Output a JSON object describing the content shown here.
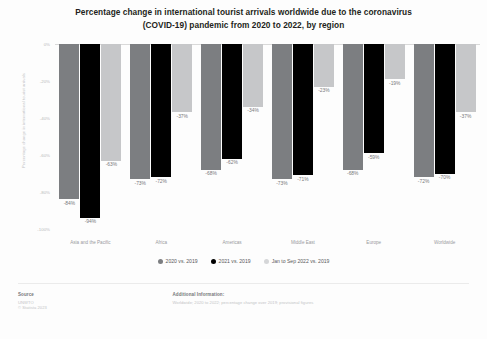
{
  "title": {
    "line1": "Percentage change in international tourist arrivals worldwide due to the coronavirus",
    "line2": "(COVID-19) pandemic from 2020 to 2022, by region"
  },
  "legend": {
    "items": [
      {
        "label": "2020 vs. 2019",
        "color": "#7c7e81"
      },
      {
        "label": "2021 vs. 2019",
        "color": "#000000"
      },
      {
        "label": "Jan to Sep 2022 vs. 2019",
        "color": "#d5d6d8"
      }
    ]
  },
  "footer": {
    "source_head": "Source",
    "source_lines": [
      "UNWTO",
      "© Statista 2023"
    ],
    "info_head": "Additional Information:",
    "info_lines": [
      "Worldwide; 2020 to 2022; percentage change over 2019; provisional figures"
    ]
  },
  "chart_data": {
    "type": "bar",
    "title": "Percentage change in international tourist arrivals worldwide due to the coronavirus (COVID-19) pandemic from 2020 to 2022, by region",
    "xlabel": "",
    "ylabel": "Percentage change in international tourist arrivals",
    "ylim": [
      -100,
      0
    ],
    "yticks": [
      "0%",
      "-20%",
      "-40%",
      "-60%",
      "-80%",
      "-100%"
    ],
    "ytick_values": [
      0,
      -20,
      -40,
      -60,
      -80,
      -100
    ],
    "grid": false,
    "legend_position": "bottom",
    "categories": [
      "Asia and the Pacific",
      "Africa",
      "Americas",
      "Middle East",
      "Europe",
      "Worldwide"
    ],
    "series": [
      {
        "name": "2020 vs. 2019",
        "color": "#7c7e81",
        "values": [
          -84,
          -73,
          -68,
          -73,
          -68,
          -72
        ],
        "labels": [
          "-84%",
          "-73%",
          "-68%",
          "-73%",
          "-68%",
          "-72%"
        ]
      },
      {
        "name": "2021 vs. 2019",
        "color": "#000000",
        "values": [
          -94,
          -72,
          -62,
          -71,
          -59,
          -70
        ],
        "labels": [
          "-94%",
          "-72%",
          "-62%",
          "-71%",
          "-59%",
          "-70%"
        ]
      },
      {
        "name": "Jan to Sep 2022 vs. 2019",
        "color": "#c6c7c9",
        "values": [
          -63,
          -37,
          -34,
          -23,
          -19,
          -37
        ],
        "labels": [
          "-63%",
          "-37%",
          "-34%",
          "-23%",
          "-19%",
          "-37%"
        ]
      }
    ]
  }
}
